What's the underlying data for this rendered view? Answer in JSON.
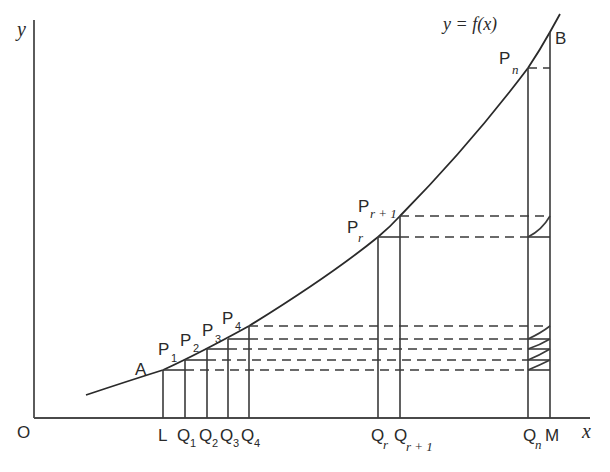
{
  "figure": {
    "curve_label": "y = f(x)",
    "axes": {
      "x_label": "x",
      "y_label": "y",
      "origin_label": "O"
    },
    "curve_points": [
      {
        "label": "A",
        "x": 163,
        "y": 370
      },
      {
        "label": "P1",
        "x": 185,
        "y": 360
      },
      {
        "label": "P2",
        "x": 207,
        "y": 349
      },
      {
        "label": "P3",
        "x": 228,
        "y": 339
      },
      {
        "label": "P4",
        "x": 249,
        "y": 326
      },
      {
        "label": "Pr",
        "x": 378,
        "y": 237
      },
      {
        "label": "Pr+1",
        "x": 400,
        "y": 216
      },
      {
        "label": "Pn",
        "x": 528,
        "y": 68
      },
      {
        "label": "B",
        "x": 550,
        "y": 32
      }
    ],
    "x_axis_points": [
      "L",
      "Q1",
      "Q2",
      "Q3",
      "Q4",
      "Qr",
      "Qr+1",
      "Qn",
      "M"
    ],
    "labels": {
      "A": "A",
      "B": "B",
      "P": "P",
      "Q": "Q",
      "L": "L",
      "M": "M",
      "sub_1": "1",
      "sub_2": "2",
      "sub_3": "3",
      "sub_4": "4",
      "sub_r": "r",
      "sub_r1": "r + 1",
      "sub_n": "n"
    }
  }
}
